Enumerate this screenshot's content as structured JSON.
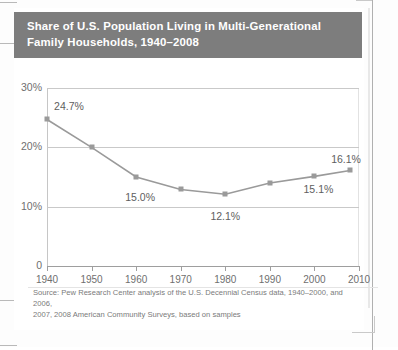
{
  "title": {
    "line1": "Share of U.S. Population Living in Multi-Generational",
    "line2": "Family Households, 1940–2008"
  },
  "source": {
    "line1": "Source: Pew Research Center analysis of the U.S. Decennial Census data, 1940–2000, and 2006,",
    "line2": "2007, 2008 American Community Surveys, based on samples"
  },
  "colors": {
    "title_bar": "#7d7d7d",
    "line": "#9a9a9a",
    "marker": "#9a9a9a",
    "grid": "#c9c9c9",
    "axis": "#9e9e9e",
    "tick_text": "#6f6f6f",
    "data_label": "#5e5e5e",
    "source_text": "#7a7a7a",
    "page": "#ffffff"
  },
  "chart_data": {
    "type": "line",
    "title": "Share of U.S. Population Living in Multi-Generational Family Households, 1940–2008",
    "xlabel": "",
    "ylabel": "",
    "x": [
      1940,
      1950,
      1960,
      1970,
      1980,
      1990,
      2000,
      2008
    ],
    "values": [
      24.7,
      20.0,
      15.0,
      12.9,
      12.1,
      14.0,
      15.1,
      16.1
    ],
    "point_labels": [
      "24.7%",
      "",
      "15.0%",
      "",
      "12.1%",
      "",
      "15.1%",
      "16.1%"
    ],
    "ylim": [
      0,
      30
    ],
    "xlim": [
      1940,
      2010
    ],
    "yticks": [
      0,
      10,
      20,
      30
    ],
    "ytick_labels": [
      "0",
      "10%",
      "20%",
      "30%"
    ],
    "xticks": [
      1940,
      1950,
      1960,
      1970,
      1980,
      1990,
      2000,
      2010
    ],
    "xtick_labels": [
      "1940",
      "1950",
      "1960",
      "1970",
      "1980",
      "1990",
      "2000",
      "2010"
    ],
    "grid": "horizontal",
    "gridlines_at": [
      10,
      20,
      30
    ],
    "legend": "none",
    "marker": "square",
    "units": "percent"
  }
}
